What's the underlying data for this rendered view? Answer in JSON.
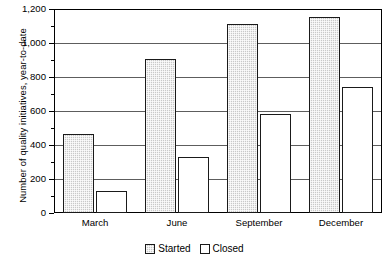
{
  "chart_data": {
    "type": "bar",
    "title": "",
    "subtitle": "",
    "xlabel": "",
    "ylabel": "Number of quality initiatives, year-to-date",
    "categories": [
      "March",
      "June",
      "September",
      "December"
    ],
    "series": [
      {
        "name": "Started",
        "values": [
          465,
          905,
          1110,
          1155
        ],
        "color": "#c9c9c9",
        "pattern": "checkered-gray"
      },
      {
        "name": "Closed",
        "values": [
          130,
          330,
          580,
          740
        ],
        "color": "#ffffff",
        "pattern": "solid-white"
      }
    ],
    "ylim": [
      0,
      1200
    ],
    "ytick_step": 200,
    "yticks": [
      0,
      200,
      400,
      600,
      800,
      1000,
      1200
    ],
    "ytick_labels": [
      "0",
      "200",
      "400",
      "600",
      "800",
      "1,000",
      "1,200"
    ],
    "yminor_step": 100,
    "grid": true,
    "grid_axis": "y",
    "legend_position": "bottom-center",
    "legend_entries": [
      "Started",
      "Closed"
    ]
  }
}
